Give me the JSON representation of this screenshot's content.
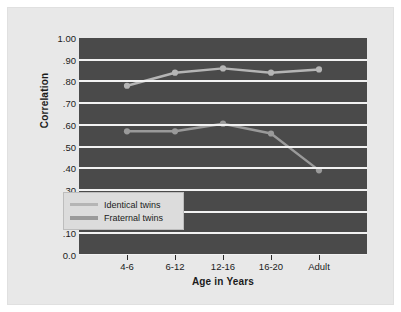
{
  "chart_data": {
    "type": "line",
    "title": "",
    "xlabel": "Age in Years",
    "ylabel": "Correlation",
    "categories": [
      "4-6",
      "6-12",
      "12-16",
      "16-20",
      "Adult"
    ],
    "ytick_labels": [
      "1.00",
      ".90",
      ".80",
      ".70",
      ".60",
      ".50",
      ".40",
      ".30",
      ".20",
      ".10",
      "0.0"
    ],
    "ytick_values": [
      1.0,
      0.9,
      0.8,
      0.7,
      0.6,
      0.5,
      0.4,
      0.3,
      0.2,
      0.1,
      0.0
    ],
    "ylim": [
      0.0,
      1.0
    ],
    "grid": true,
    "legend_position": "lower-left-inside",
    "series": [
      {
        "name": "Identical twins",
        "color": "#b5b5b5",
        "values": [
          0.78,
          0.84,
          0.86,
          0.84,
          0.855
        ]
      },
      {
        "name": "Fraternal twins",
        "color": "#9a9a9a",
        "values": [
          0.57,
          0.57,
          0.605,
          0.56,
          0.39
        ]
      }
    ]
  },
  "legend": {
    "items": [
      {
        "label": "Identical twins"
      },
      {
        "label": "Fraternal twins"
      }
    ]
  },
  "colors": {
    "plot_background": "#4a4a4a",
    "gridline": "#f2f2f2",
    "panel_background": "#e8e8e8",
    "text": "#1b1b1b",
    "identical": "#b5b5b5",
    "fraternal": "#9a9a9a"
  }
}
